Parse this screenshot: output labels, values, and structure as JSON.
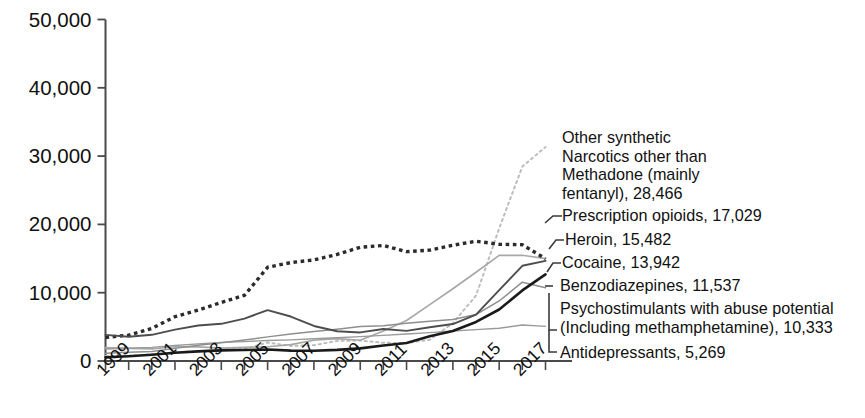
{
  "chart_data": {
    "type": "line",
    "title": "",
    "subtitle": "",
    "xlabel": "",
    "ylabel": "",
    "xlim": [
      1999,
      2018
    ],
    "ylim": [
      0,
      50000
    ],
    "grid": false,
    "legend_position": "right-inline-annotations",
    "x": [
      1999,
      2000,
      2001,
      2002,
      2003,
      2004,
      2005,
      2006,
      2007,
      2008,
      2009,
      2010,
      2011,
      2012,
      2013,
      2014,
      2015,
      2016,
      2017,
      2018
    ],
    "x_tick_labels": [
      "1999",
      "2001",
      "2003",
      "2005",
      "2007",
      "2009",
      "2011",
      "2013",
      "2015",
      "2017"
    ],
    "y_tick_labels": [
      "0",
      "10,000",
      "20,000",
      "30,000",
      "40,000",
      "50,000"
    ],
    "y_ticks": [
      0,
      10000,
      20000,
      30000,
      40000,
      50000
    ],
    "series": [
      {
        "name": "Other synthetic Narcotics other than Methadone (mainly fentanyl)",
        "style": "dotted-light",
        "color": "#bdbdbd",
        "final_value": 28466,
        "values": [
          730,
          782,
          957,
          1295,
          1400,
          1664,
          1742,
          2707,
          2213,
          2306,
          2946,
          3007,
          2666,
          2628,
          3105,
          5544,
          9580,
          19413,
          28466,
          31335
        ]
      },
      {
        "name": "Prescription opioids",
        "style": "dotted-bold",
        "color": "#2b2b2b",
        "final_value": 17029,
        "values": [
          3442,
          3785,
          4770,
          6487,
          7456,
          8577,
          9612,
          13723,
          14408,
          14800,
          15597,
          16651,
          16917,
          16007,
          16235,
          16941,
          17536,
          17087,
          17029,
          14975
        ]
      },
      {
        "name": "Heroin",
        "style": "solid-light",
        "color": "#a8a8a8",
        "final_value": 15482,
        "values": [
          1960,
          1842,
          1779,
          2089,
          2080,
          1878,
          2009,
          2088,
          2399,
          3041,
          3278,
          3036,
          4397,
          5925,
          8257,
          10574,
          12989,
          15469,
          15482,
          14996
        ]
      },
      {
        "name": "Cocaine",
        "style": "solid-medium",
        "color": "#4d4d4d",
        "final_value": 13942,
        "values": [
          3822,
          3544,
          3833,
          4599,
          5196,
          5443,
          6208,
          7448,
          6512,
          5129,
          4350,
          4183,
          4681,
          4404,
          4944,
          5415,
          6784,
          10375,
          13942,
          14666
        ]
      },
      {
        "name": "Benzodiazepines",
        "style": "solid-grayline",
        "color": "#8e8e8e",
        "final_value": 11537,
        "values": [
          1135,
          1298,
          1399,
          1849,
          2310,
          2663,
          3080,
          3532,
          3958,
          4310,
          4660,
          5052,
          5176,
          5545,
          5827,
          6063,
          6793,
          8791,
          11537,
          10724
        ]
      },
      {
        "name": "Psychostimulants with abuse potential (Including methamphetamine)",
        "style": "solid-dark",
        "color": "#1a1a1a",
        "final_value": 10333,
        "values": [
          547,
          702,
          924,
          1212,
          1413,
          1560,
          1608,
          1683,
          1526,
          1509,
          1632,
          1854,
          2266,
          2635,
          3627,
          4402,
          5716,
          7542,
          10333,
          12676
        ]
      },
      {
        "name": "Antidepressants",
        "style": "solid-thin-gray",
        "color": "#9a9a9a",
        "final_value": 5269,
        "values": [
          1749,
          1864,
          1994,
          2277,
          2509,
          2730,
          2837,
          3000,
          3100,
          3250,
          3400,
          3570,
          3750,
          3950,
          4150,
          4400,
          4600,
          4800,
          5269,
          5064
        ]
      }
    ],
    "annotations": [
      {
        "id": "ann-fentanyl",
        "lines": [
          "Other synthetic",
          "Narcotics other than",
          "Methadone (mainly",
          "fentanyl), 28,466"
        ]
      },
      {
        "id": "ann-rx-opioids",
        "lines": [
          "Prescription opioids, 17,029"
        ]
      },
      {
        "id": "ann-heroin",
        "lines": [
          "Heroin, 15,482"
        ]
      },
      {
        "id": "ann-cocaine",
        "lines": [
          "Cocaine, 13,942"
        ]
      },
      {
        "id": "ann-benzos",
        "lines": [
          "Benzodiazepines, 11,537"
        ]
      },
      {
        "id": "ann-psychostim",
        "lines": [
          "Psychostimulants with abuse potential",
          "(Including methamphetamine), 10,333"
        ]
      },
      {
        "id": "ann-antidep",
        "lines": [
          "Antidepressants, 5,269"
        ]
      }
    ]
  },
  "axis": {
    "y_labels": [
      "50,000",
      "40,000",
      "30,000",
      "20,000",
      "10,000",
      "0"
    ],
    "x_labels": [
      "1999",
      "2001",
      "2003",
      "2005",
      "2007",
      "2009",
      "2011",
      "2013",
      "2015",
      "2017"
    ]
  },
  "annotation_text": {
    "fentanyl_l1": "Other synthetic",
    "fentanyl_l2": "Narcotics other than",
    "fentanyl_l3": "Methadone (mainly",
    "fentanyl_l4": "fentanyl), 28,466",
    "rx_opioids": "Prescription opioids, 17,029",
    "heroin": "Heroin, 15,482",
    "cocaine": "Cocaine, 13,942",
    "benzodiazepines": "Benzodiazepines, 11,537",
    "psychostimulants_l1": "Psychostimulants with abuse potential",
    "psychostimulants_l2": "(Including methamphetamine), 10,333",
    "antidepressants": "Antidepressants, 5,269"
  }
}
